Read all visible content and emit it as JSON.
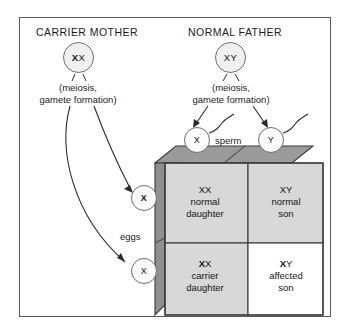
{
  "diagram": {
    "title_mother": "CARRIER MOTHER",
    "title_father": "NORMAL FATHER",
    "colors": {
      "frame_border": "#555a5d",
      "circle_fill": "#f0f0f0",
      "box_top_face": "#9a9a9a",
      "box_left_face": "#8f8f8f",
      "cell_shaded": "#d8d8d8",
      "cell_white": "#ffffff",
      "line": "#2b2b2b"
    }
  },
  "parents": {
    "mother": {
      "genotype_bold": "X",
      "genotype_rest": "X",
      "meiosis_line1": "(meiosis,",
      "meiosis_line2": "gamete formation)"
    },
    "father": {
      "genotype_bold": "",
      "genotype_rest": "XY",
      "meiosis_line1": "(meiosis,",
      "meiosis_line2": "gamete formation)"
    }
  },
  "gametes": {
    "sperm_label": "sperm",
    "eggs_label": "eggs",
    "sperm": [
      {
        "name": "sperm-x",
        "allele": "X"
      },
      {
        "name": "sperm-y",
        "allele": "Y"
      }
    ],
    "eggs": [
      {
        "name": "egg-carrier",
        "allele": "X",
        "bold": true
      },
      {
        "name": "egg-normal",
        "allele": "X",
        "bold": false
      }
    ]
  },
  "punnett": {
    "cells": [
      {
        "position": "top-left",
        "genotype_bold": "",
        "genotype_rest": "XX",
        "line2": "normal",
        "line3": "daughter",
        "shaded": true
      },
      {
        "position": "top-right",
        "genotype_bold": "",
        "genotype_rest": "XY",
        "line2": "normal",
        "line3": "son",
        "shaded": true
      },
      {
        "position": "bottom-left",
        "genotype_bold": "X",
        "genotype_rest": "X",
        "line2": "carrier",
        "line3": "daughter",
        "shaded": true
      },
      {
        "position": "bottom-right",
        "genotype_bold": "X",
        "genotype_rest": "Y",
        "line2": "affected",
        "line3": "son",
        "shaded": false
      }
    ]
  },
  "icons": {
    "sperm_tail": "squiggly-tail-icon",
    "arrow": "arrow-icon"
  }
}
